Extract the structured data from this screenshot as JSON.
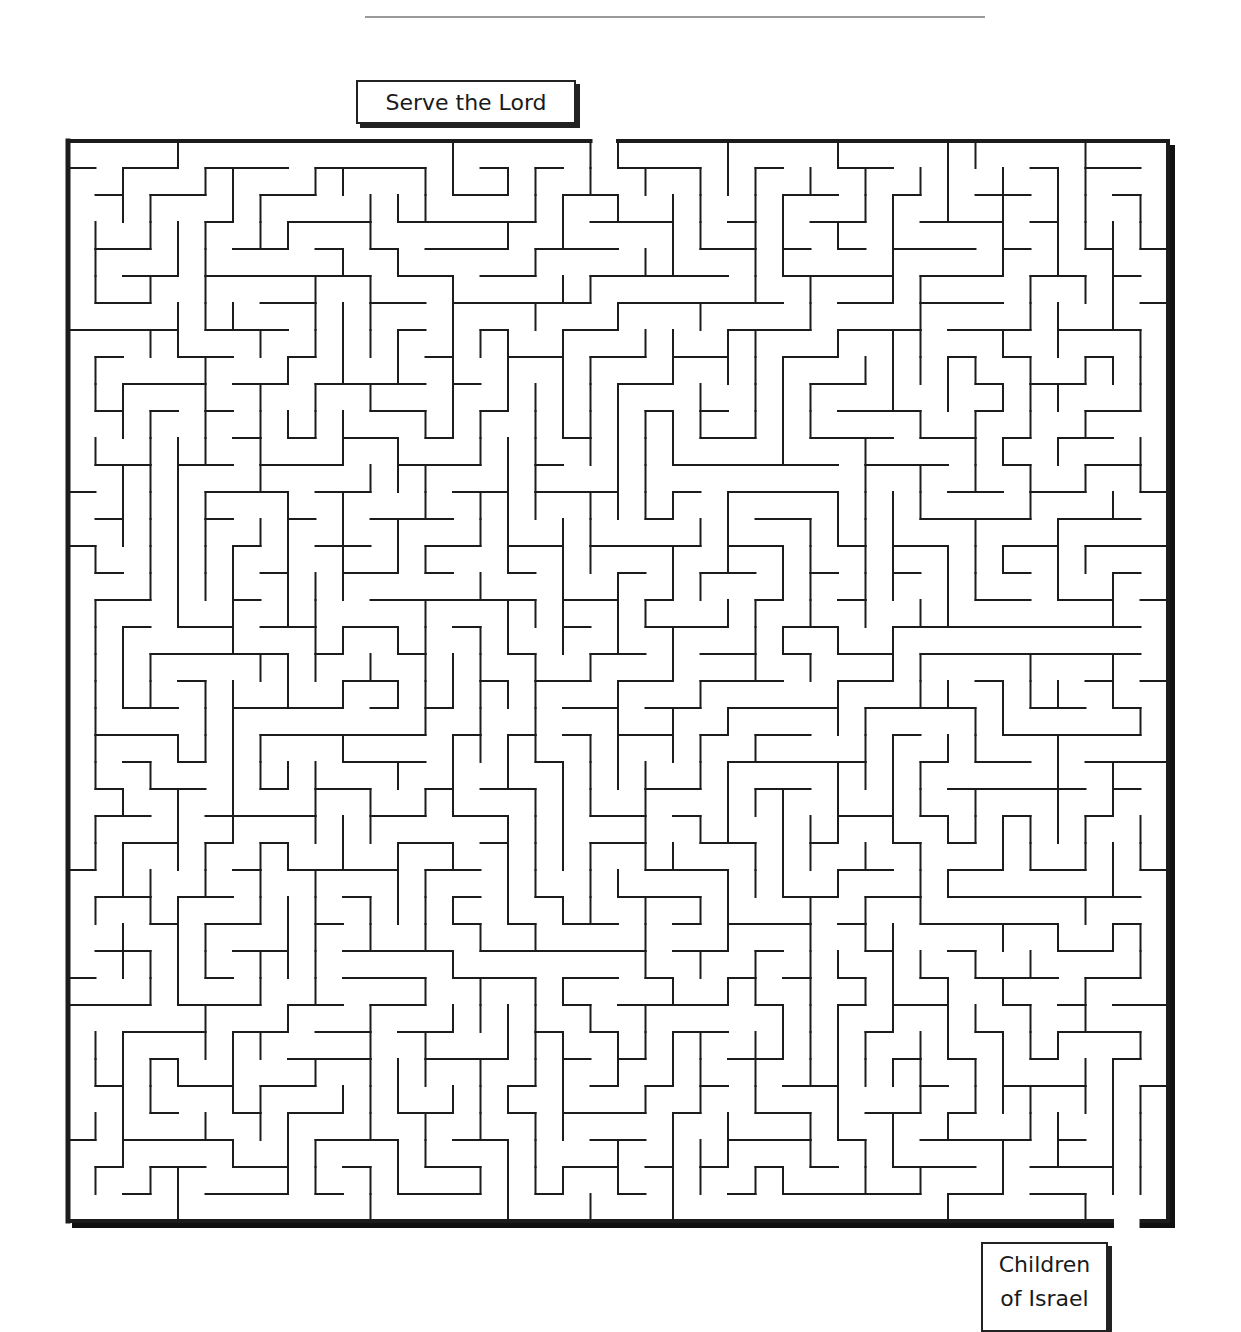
{
  "page": {
    "type": "maze-puzzle-worksheet"
  },
  "start_label": {
    "text": "Serve the Lord"
  },
  "end_label": {
    "line1": "Children",
    "line2": "of Israel"
  },
  "maze": {
    "columns": 40,
    "rows": 40,
    "origin_x": 68,
    "origin_y": 141,
    "cell_width": 27.5,
    "cell_height": 27.0,
    "entrance": {
      "side": "top",
      "column": 19
    },
    "exit": {
      "side": "bottom",
      "column": 38
    },
    "wall_color": "#1c1c1c",
    "frame_shadow_color": "#111111",
    "seed": 7
  },
  "colors": {
    "background": "#ffffff",
    "ink": "#1c1c1c",
    "rule": "#9a9a9a"
  }
}
